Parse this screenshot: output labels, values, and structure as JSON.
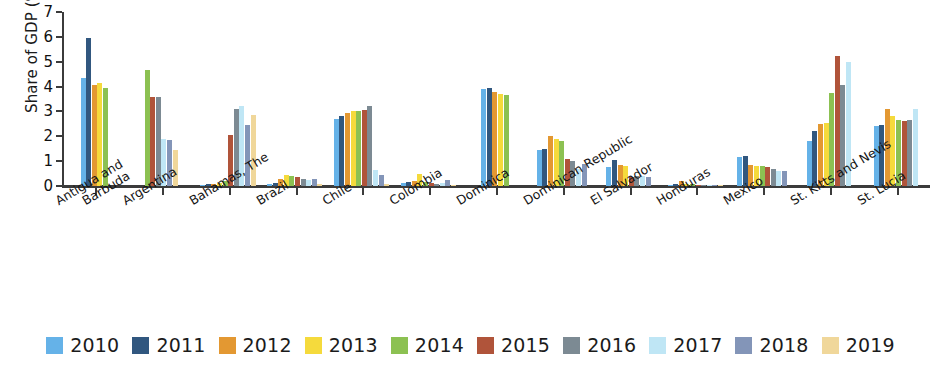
{
  "chart_data": {
    "type": "bar",
    "title": "",
    "xlabel": "",
    "ylabel": "Share of GDP (%)",
    "ylim": [
      0,
      7
    ],
    "yticks": [
      "0",
      "1",
      "2",
      "3",
      "4",
      "5",
      "6",
      "7"
    ],
    "grid": false,
    "legend_position": "bottom",
    "categories": [
      "Antigua and Barbuda",
      "Argentina",
      "Bahamas, The",
      "Brazil",
      "Chile",
      "Colombia",
      "Dominica",
      "Dominican Republic",
      "El Salvador",
      "Honduras",
      "Mexico",
      "St. Kitts and Nevis",
      "St. Lucia"
    ],
    "category_lines": [
      [
        "Antigua and",
        "Barbuda"
      ],
      [
        "Argentina"
      ],
      [
        "Bahamas, The"
      ],
      [
        "Brazil"
      ],
      [
        "Chile"
      ],
      [
        "Colombia"
      ],
      [
        "Dominica"
      ],
      [
        "Dominican Republic"
      ],
      [
        "El Salvador"
      ],
      [
        "Honduras"
      ],
      [
        "Mexico"
      ],
      [
        "St. Kitts and Nevis"
      ],
      [
        "St. Lucia"
      ]
    ],
    "series": [
      {
        "name": "2010",
        "color": "#65b2e8",
        "values": [
          4.35,
          null,
          0.05,
          0.1,
          2.7,
          0.12,
          3.9,
          1.45,
          0.75,
          0.05,
          1.15,
          1.8,
          2.4
        ]
      },
      {
        "name": "2011",
        "color": "#31577f",
        "values": [
          5.95,
          null,
          0.08,
          0.12,
          2.8,
          0.18,
          3.95,
          1.5,
          1.05,
          0.1,
          1.2,
          2.2,
          2.45
        ]
      },
      {
        "name": "2012",
        "color": "#e39832",
        "values": [
          4.05,
          null,
          0.1,
          0.3,
          2.95,
          0.2,
          3.8,
          2.0,
          0.85,
          0.2,
          0.85,
          2.5,
          3.1
        ]
      },
      {
        "name": "2013",
        "color": "#f5da3c",
        "values": [
          4.15,
          null,
          0.12,
          0.45,
          3.0,
          0.5,
          3.7,
          1.9,
          0.8,
          0.1,
          0.8,
          2.55,
          2.8
        ]
      },
      {
        "name": "2014",
        "color": "#8cc152",
        "values": [
          3.95,
          4.65,
          0.2,
          0.4,
          3.0,
          0.15,
          3.65,
          1.8,
          null,
          0.08,
          0.8,
          3.75,
          2.65
        ]
      },
      {
        "name": "2015",
        "color": "#b0543a",
        "values": [
          null,
          3.6,
          2.05,
          0.35,
          3.05,
          0.12,
          null,
          1.1,
          0.35,
          0.05,
          0.75,
          5.25,
          2.6
        ]
      },
      {
        "name": "2016",
        "color": "#7c8a93",
        "values": [
          null,
          3.6,
          3.1,
          0.3,
          3.2,
          0.1,
          null,
          1.0,
          0.4,
          0.05,
          0.7,
          4.05,
          2.65
        ]
      },
      {
        "name": "2017",
        "color": "#bfe6f5",
        "values": [
          null,
          1.9,
          3.2,
          0.25,
          0.65,
          0.12,
          null,
          0.7,
          0.4,
          0.04,
          0.6,
          5.0,
          3.1
        ]
      },
      {
        "name": "2018",
        "color": "#8395b8",
        "values": [
          null,
          1.85,
          2.45,
          0.3,
          0.45,
          0.25,
          null,
          0.9,
          0.35,
          0.04,
          0.6,
          null,
          null
        ]
      },
      {
        "name": "2019",
        "color": "#f0d79a",
        "values": [
          null,
          1.45,
          2.85,
          0.1,
          0.1,
          0.05,
          null,
          null,
          null,
          0.03,
          null,
          null,
          null
        ]
      }
    ]
  },
  "legend": {
    "items": [
      {
        "label": "2010",
        "color": "#65b2e8"
      },
      {
        "label": "2011",
        "color": "#31577f"
      },
      {
        "label": "2012",
        "color": "#e39832"
      },
      {
        "label": "2013",
        "color": "#f5da3c"
      },
      {
        "label": "2014",
        "color": "#8cc152"
      },
      {
        "label": "2015",
        "color": "#b0543a"
      },
      {
        "label": "2016",
        "color": "#7c8a93"
      },
      {
        "label": "2017",
        "color": "#bfe6f5"
      },
      {
        "label": "2018",
        "color": "#8395b8"
      },
      {
        "label": "2019",
        "color": "#f0d79a"
      }
    ]
  },
  "axis": {
    "y_title": "Share of GDP (%)"
  }
}
